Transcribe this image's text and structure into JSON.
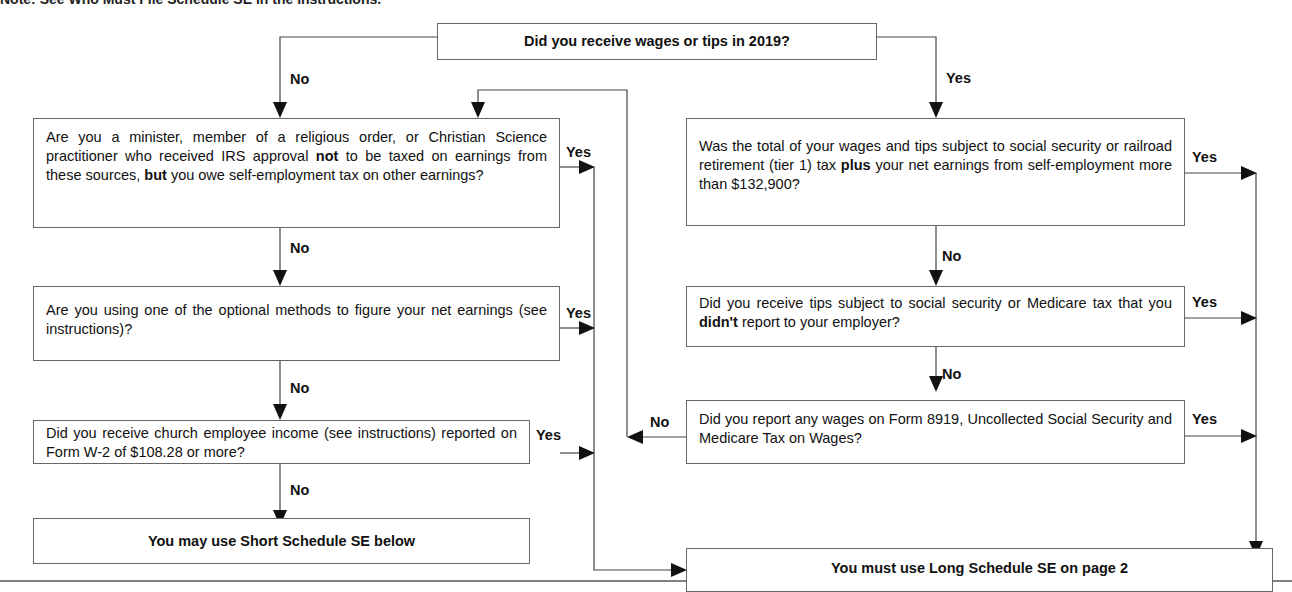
{
  "header": {
    "cut_text": "Note: See Who Must File Schedule SE in the instructions."
  },
  "start": {
    "question": "Did you receive wages or tips in 2019?"
  },
  "left": [
    {
      "question_parts": [
        "Are you a minister, member of a religious order, or Christian Science practitioner who received IRS approval ",
        "not",
        " to be taxed on earnings from these sources, ",
        "but",
        " you owe self-employment tax on other earnings?"
      ],
      "yes": "Yes",
      "no": "No"
    },
    {
      "question": "Are you using one of the optional methods to figure your net earnings (see instructions)?",
      "yes": "Yes",
      "no": "No"
    },
    {
      "question": "Did you receive church employee income (see instructions) reported on Form  W-2 of $108.28 or more?",
      "yes": "Yes",
      "no": "No"
    }
  ],
  "right": [
    {
      "question_parts": [
        "Was the total of your wages and tips subject to social security or railroad retirement (tier 1) tax ",
        "plus",
        " your net earnings from self-employment more than $132,900?"
      ],
      "yes": "Yes",
      "no": "No"
    },
    {
      "question_parts": [
        "Did you receive tips subject to social security or Medicare tax that you ",
        "didn't",
        " report to your employer?"
      ],
      "yes": "Yes",
      "no": "No"
    },
    {
      "question": "Did you report any wages on Form 8919, Uncollected Social Security and Medicare Tax on Wages?",
      "yes": "Yes",
      "no": "No"
    }
  ],
  "start_branches": {
    "no": "No",
    "yes": "Yes"
  },
  "outcomes": {
    "short": "You may use Short Schedule SE below",
    "long": "You must use Long Schedule SE on page 2"
  },
  "colors": {
    "line": "#444444",
    "border": "#666666",
    "text": "#111111"
  }
}
